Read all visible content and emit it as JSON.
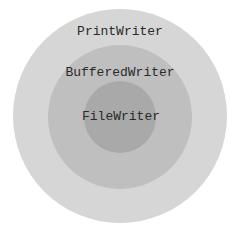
{
  "diagram": {
    "type": "nested-circles",
    "layers": [
      {
        "label": "PrintWriter",
        "color": "#d6d6d6",
        "cx": 120,
        "cy": 116,
        "r": 107,
        "label_y": 17
      },
      {
        "label": "BufferedWriter",
        "color": "#bfbfbf",
        "cx": 120,
        "cy": 117,
        "r": 72,
        "label_y": 64
      },
      {
        "label": "FileWriter",
        "color": "#a9a9a9",
        "cx": 120,
        "cy": 117,
        "r": 36,
        "label_y": 108
      }
    ]
  }
}
